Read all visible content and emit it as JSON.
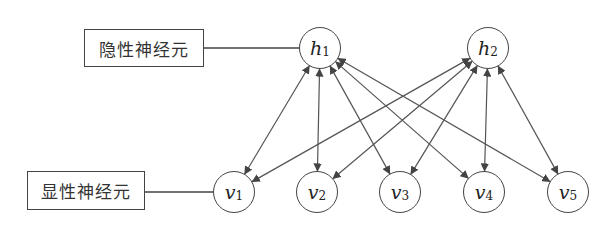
{
  "labels": {
    "hidden": "隐性神经元",
    "visible": "显性神经元"
  },
  "hidden_nodes": [
    {
      "var": "h",
      "sub": "1"
    },
    {
      "var": "h",
      "sub": "2"
    }
  ],
  "visible_nodes": [
    {
      "var": "v",
      "sub": "1"
    },
    {
      "var": "v",
      "sub": "2"
    },
    {
      "var": "v",
      "sub": "3"
    },
    {
      "var": "v",
      "sub": "4"
    },
    {
      "var": "v",
      "sub": "5"
    }
  ],
  "connections": "fully connected bidirectional edges between each hidden node (h1, h2) and each visible node (v1..v5)"
}
